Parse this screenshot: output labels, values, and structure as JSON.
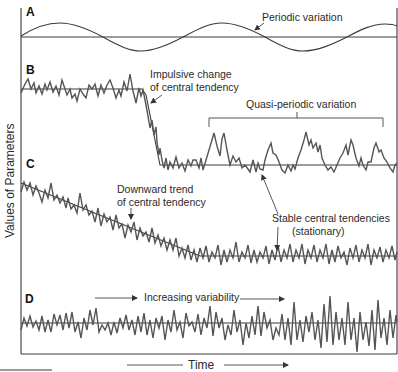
{
  "figure": {
    "y_axis_label": "Values of Parameters",
    "x_axis_label": "Time",
    "panels": [
      {
        "id": "A",
        "label": "A",
        "annotations": [
          "Periodic variation"
        ]
      },
      {
        "id": "B",
        "label": "B",
        "annotations": [
          "Impulsive change",
          "of central tendency",
          "Quasi-periodic variation"
        ]
      },
      {
        "id": "C",
        "label": "C",
        "annotations": [
          "Downward trend",
          "of central tendency",
          "Stable central tendencies",
          "(stationary)"
        ]
      },
      {
        "id": "D",
        "label": "D",
        "annotations": [
          "Increasing variability"
        ]
      }
    ]
  },
  "colors": {
    "line": "#3a3a3a",
    "signal": "#555555",
    "text": "#2a2a2a",
    "background": "#ffffff"
  }
}
